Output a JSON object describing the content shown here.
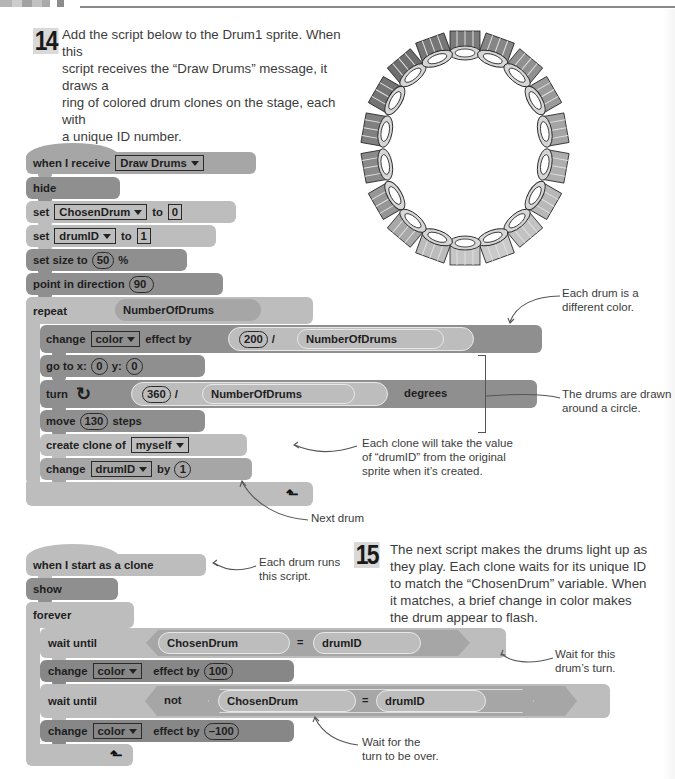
{
  "page": {
    "header_swatches": [
      "#b8b8b8",
      "#cfcfcf",
      "#9e9e9e",
      "#c4c4c4",
      "#a8a8a8",
      "#8c8c8c"
    ]
  },
  "step14": {
    "number": "14",
    "text_lines": [
      "Add the script below to the Drum1 sprite. When this",
      "script receives the “Draw Drums” message, it draws a",
      "ring of colored drum clones on the stage, each with",
      "a unique ID number."
    ]
  },
  "step15": {
    "number": "15",
    "text_lines": [
      "The next script makes the drums light up as",
      "they play. Each clone waits for its unique ID",
      "to match the “ChosenDrum” variable. When",
      "it matches, a brief change in color makes",
      "the drum appear to flash."
    ]
  },
  "script1": {
    "hat": {
      "label": "when I receive",
      "message": "Draw Drums"
    },
    "hide": "hide",
    "set1": {
      "label": "set",
      "var": "ChosenDrum",
      "to": "to",
      "value": "0"
    },
    "set2": {
      "label": "set",
      "var": "drumID",
      "to": "to",
      "value": "1"
    },
    "size": {
      "label": "set size to",
      "value": "50",
      "unit": "%"
    },
    "direction": {
      "label": "point in direction",
      "value": "90"
    },
    "repeat": {
      "label": "repeat",
      "count": "NumberOfDrums"
    },
    "change_effect": {
      "label": "change",
      "effect": "color",
      "by": "effect by",
      "numerator": "200",
      "op": "/",
      "denominator": "NumberOfDrums"
    },
    "goto": {
      "label": "go to x:",
      "x": "0",
      "ylabel": "y:",
      "y": "0"
    },
    "turn": {
      "label": "turn",
      "numerator": "360",
      "op": "/",
      "denominator": "NumberOfDrums",
      "unit": "degrees"
    },
    "move": {
      "label": "move",
      "value": "130",
      "unit": "steps"
    },
    "clone": {
      "label": "create clone of",
      "target": "myself"
    },
    "change_var": {
      "label": "change",
      "var": "drumID",
      "by": "by",
      "value": "1"
    }
  },
  "script2": {
    "hat": "when I start as a clone",
    "show": "show",
    "forever": "forever",
    "wait1": {
      "label": "wait until",
      "left": "ChosenDrum",
      "op": "=",
      "right": "drumID"
    },
    "change1": {
      "label": "change",
      "effect": "color",
      "by": "effect by",
      "value": "100"
    },
    "wait2": {
      "label": "wait until",
      "not": "not",
      "left": "ChosenDrum",
      "op": "=",
      "right": "drumID"
    },
    "change2": {
      "label": "change",
      "effect": "color",
      "by": "effect by",
      "value": "–100"
    }
  },
  "callouts": {
    "different_color": [
      "Each drum is a",
      "different color."
    ],
    "drawn_circle": [
      "The drums are drawn",
      "around a circle."
    ],
    "clone_value": [
      "Each clone will take the value",
      "of “drumID” from the original",
      "sprite when it’s created."
    ],
    "next_drum": [
      "Next drum"
    ],
    "each_drum_runs": [
      "Each drum runs",
      "this script."
    ],
    "wait_turn": [
      "Wait for this",
      "drum’s turn."
    ],
    "wait_over": [
      "Wait for the",
      "turn to be over."
    ]
  },
  "stage_image": {
    "description": "Ring of drum clones",
    "drum_count": 18
  }
}
